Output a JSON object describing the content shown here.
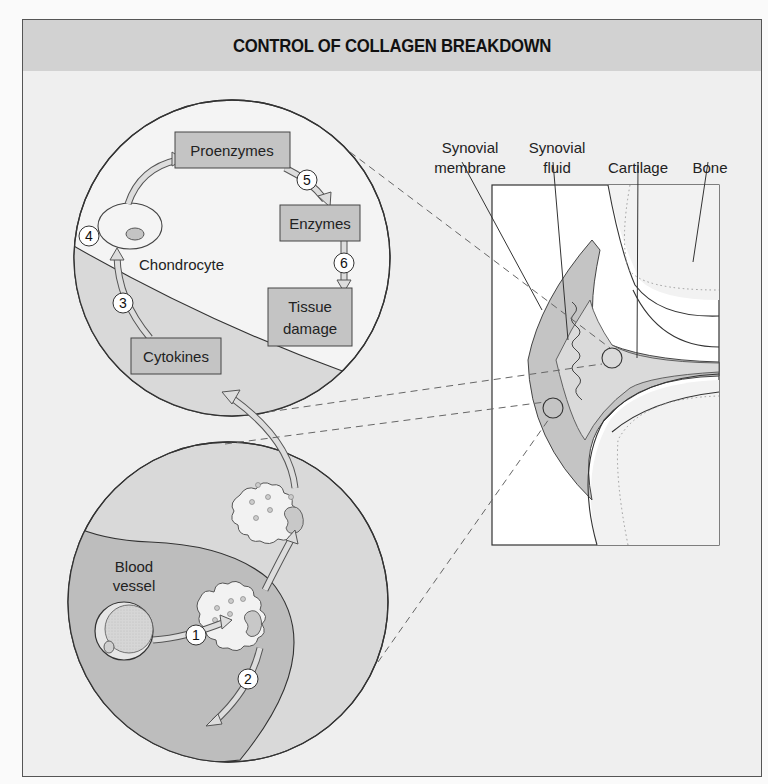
{
  "title": "CONTROL OF COLLAGEN BREAKDOWN",
  "colors": {
    "header_bg": "#d2d2d2",
    "panel_bg": "#efefef",
    "box_fill": "#c4c4c4",
    "tissue_light": "#dcdcdc",
    "tissue_dark": "#bdbdbd",
    "stroke": "#333333"
  },
  "upper_circle": {
    "boxes": {
      "proenzymes": "Proenzymes",
      "enzymes": "Enzymes",
      "tissue_damage_line1": "Tissue",
      "tissue_damage_line2": "damage",
      "cytokines": "Cytokines"
    },
    "cell_label": "Chondrocyte",
    "steps": {
      "s3": "3",
      "s4": "4",
      "s5": "5",
      "s6": "6"
    }
  },
  "lower_circle": {
    "vessel_label_line1": "Blood",
    "vessel_label_line2": "vessel",
    "steps": {
      "s1": "1",
      "s2": "2"
    }
  },
  "joint": {
    "labels": {
      "synovial_membrane_line1": "Synovial",
      "synovial_membrane_line2": "membrane",
      "synovial_fluid_line1": "Synovial",
      "synovial_fluid_line2": "fluid",
      "cartilage": "Cartilage",
      "bone": "Bone"
    }
  }
}
